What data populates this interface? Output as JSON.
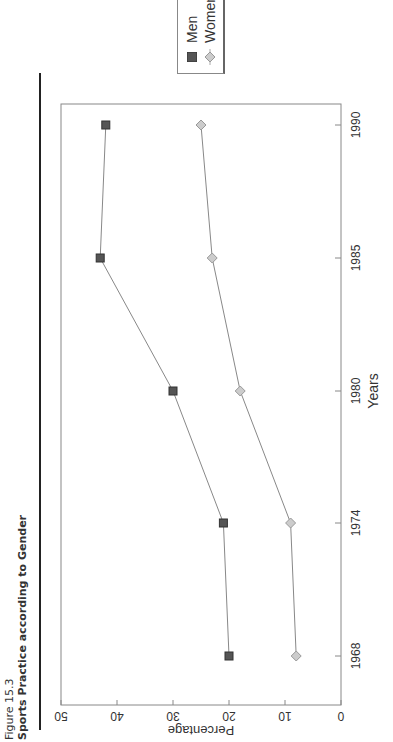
{
  "figure": {
    "label": "Figure 15.3",
    "title": "Sports Practice according to Gender"
  },
  "legend": {
    "items": [
      {
        "label": "Men",
        "marker": "filled-square-icon",
        "color": "#555555"
      },
      {
        "label": "Women",
        "marker": "diamond-icon",
        "color": "#aaaaaa"
      }
    ]
  },
  "axes": {
    "xlabel": "Years",
    "ylabel": "Percentage",
    "x_ticks": [
      "1968",
      "1974",
      "1980",
      "1985",
      "1990"
    ],
    "y_ticks": [
      "0",
      "10",
      "20",
      "30",
      "40",
      "50"
    ]
  },
  "chart_data": {
    "type": "line",
    "title": "Sports Practice according to Gender",
    "categories": [
      "1968",
      "1974",
      "1980",
      "1985",
      "1990"
    ],
    "series": [
      {
        "name": "Men",
        "values": [
          20,
          21,
          30,
          43,
          42
        ],
        "marker": "square",
        "color": "#555555"
      },
      {
        "name": "Women",
        "values": [
          8,
          9,
          18,
          23,
          25
        ],
        "marker": "diamond",
        "color": "#aaaaaa"
      }
    ],
    "xlabel": "Years",
    "ylabel": "Percentage",
    "ylim": [
      0,
      50
    ],
    "y_ticks": [
      0,
      10,
      20,
      30,
      40,
      50
    ],
    "grid": false,
    "legend_position": "right",
    "orientation_note": "page rotated 90 degrees"
  }
}
